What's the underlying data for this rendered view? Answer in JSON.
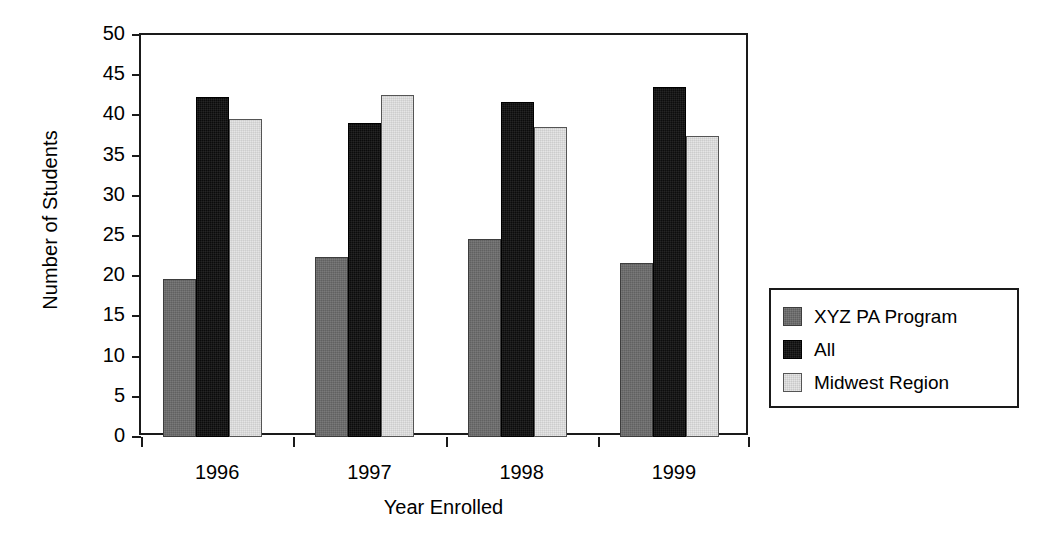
{
  "chart_data": {
    "type": "bar",
    "title": "",
    "xlabel": "Year Enrolled",
    "ylabel": "Number of Students",
    "categories": [
      "1996",
      "1997",
      "1998",
      "1999"
    ],
    "series": [
      {
        "name": "XYZ PA Program",
        "color": "#6b6b6b",
        "values": [
          19.7,
          22.4,
          24.6,
          21.6
        ]
      },
      {
        "name": "All",
        "color": "#0d0d0d",
        "values": [
          42.3,
          39.1,
          41.7,
          43.5
        ]
      },
      {
        "name": "Midwest Region",
        "color": "#e3e3e3",
        "values": [
          39.6,
          42.6,
          38.6,
          37.5
        ]
      }
    ],
    "ylim": [
      0,
      50
    ],
    "yticks": [
      0,
      5,
      10,
      15,
      20,
      25,
      30,
      35,
      40,
      45,
      50
    ],
    "ytick_labels": [
      "0",
      "5",
      "10",
      "15",
      "20",
      "25",
      "30",
      "35",
      "40",
      "45",
      "50"
    ],
    "grid": false,
    "legend_position": "right",
    "legend_entries": [
      "XYZ PA Program",
      "All",
      "Midwest Region"
    ]
  }
}
